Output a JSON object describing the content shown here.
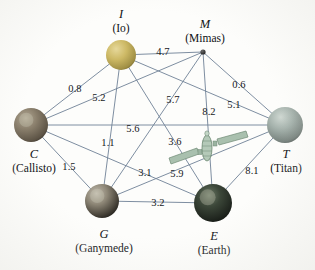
{
  "figure": {
    "background_color": "#fdfdfb",
    "edge_color": "#6f8196",
    "label_color": "#16181c"
  },
  "nodes": [
    {
      "id": "I",
      "symbol": "I",
      "name": "(Io)",
      "x": 121,
      "y": 55,
      "r": 15,
      "kind": "moon-io",
      "caption_x": 121,
      "caption_y": 8,
      "color": "#c9b464"
    },
    {
      "id": "M",
      "symbol": "M",
      "name": "(Mimas)",
      "x": 203,
      "y": 52,
      "r": 2.6,
      "kind": "moon-mimas",
      "caption_x": 205,
      "caption_y": 18,
      "color": "#2b2b2b"
    },
    {
      "id": "C",
      "symbol": "C",
      "name": "(Callisto)",
      "x": 31,
      "y": 125,
      "r": 17,
      "kind": "moon-callisto",
      "caption_x": 34,
      "caption_y": 148,
      "color": "#7c7163"
    },
    {
      "id": "T",
      "symbol": "T",
      "name": "(Titan)",
      "x": 285,
      "y": 125,
      "r": 18,
      "kind": "moon-titan",
      "caption_x": 286,
      "caption_y": 148,
      "color": "#9aa5a0"
    },
    {
      "id": "G",
      "symbol": "G",
      "name": "(Ganymede)",
      "x": 102,
      "y": 201,
      "r": 17,
      "kind": "moon-ganymede",
      "caption_x": 104,
      "caption_y": 228,
      "color": "#837a6e"
    },
    {
      "id": "E",
      "symbol": "E",
      "name": "(Earth)",
      "x": 213,
      "y": 203,
      "r": 19,
      "kind": "planet-earth",
      "caption_x": 214,
      "caption_y": 230,
      "color": "#2a2f2b"
    }
  ],
  "edges": [
    {
      "from": "I",
      "to": "M",
      "weight": "4.7",
      "label_x": 163,
      "label_y": 51
    },
    {
      "from": "C",
      "to": "I",
      "weight": "0.8",
      "label_x": 75,
      "label_y": 88
    },
    {
      "from": "I",
      "to": "G",
      "weight": "5.2",
      "label_x": 99,
      "label_y": 97
    },
    {
      "from": "M",
      "to": "T",
      "weight": "0.6",
      "label_x": 239,
      "label_y": 84
    },
    {
      "from": "C",
      "to": "M",
      "weight": "5.7",
      "label_x": 173,
      "label_y": 99
    },
    {
      "from": "M",
      "to": "E",
      "weight": "8.2",
      "label_x": 209,
      "label_y": 111
    },
    {
      "from": "I",
      "to": "T",
      "weight": "5.1",
      "label_x": 234,
      "label_y": 104
    },
    {
      "from": "C",
      "to": "T",
      "weight": "5.6",
      "label_x": 133,
      "label_y": 128
    },
    {
      "from": "I",
      "to": "E",
      "weight": "1.1",
      "label_x": 108,
      "label_y": 142
    },
    {
      "from": "M",
      "to": "G",
      "weight": "3.6",
      "label_x": 175,
      "label_y": 141
    },
    {
      "from": "C",
      "to": "G",
      "weight": "1.5",
      "label_x": 69,
      "label_y": 166
    },
    {
      "from": "G",
      "to": "T",
      "weight": "3.1",
      "label_x": 145,
      "label_y": 172
    },
    {
      "from": "E",
      "to": "C",
      "weight": "5.9",
      "label_x": 177,
      "label_y": 173
    },
    {
      "from": "E",
      "to": "T",
      "weight": "8.1",
      "label_x": 252,
      "label_y": 170
    },
    {
      "from": "G",
      "to": "E",
      "weight": "3.2",
      "label_x": 158,
      "label_y": 202
    }
  ],
  "satellite": {
    "name": "satellite-icon",
    "x": 207,
    "y": 148,
    "color": "#a9c0ae",
    "edge_color": "#6f8a74"
  }
}
